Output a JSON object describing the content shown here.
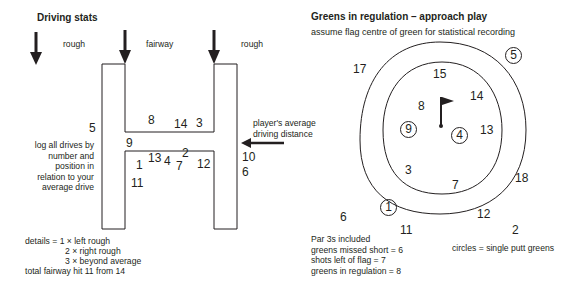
{
  "driving": {
    "title": "Driving stats",
    "labels": {
      "rough_left": "rough",
      "fairway": "fairway",
      "rough_right": "rough"
    },
    "avg_label_1": "player's average",
    "avg_label_2": "driving distance",
    "instructions": [
      "log all drives by",
      "number and",
      "position in",
      "relation to your",
      "average drive"
    ],
    "drives": {
      "d1": "1",
      "d2": "2",
      "d3": "3",
      "d4": "4",
      "d5": "5",
      "d6": "6",
      "d7": "7",
      "d8": "8",
      "d9": "9",
      "d10": "10",
      "d11": "11",
      "d12": "12",
      "d13": "13",
      "d14": "14"
    },
    "details": [
      "details = 1 × left rough",
      "2 × right rough",
      "3 × beyond average",
      "total fairway hit  11 from 14"
    ]
  },
  "greens": {
    "title": "Greens in regulation – approach play",
    "subtitle": "assume flag centre of green for statistical recording",
    "holes": {
      "h1": "1",
      "h2": "2",
      "h3": "3",
      "h4": "4",
      "h5": "5",
      "h6": "6",
      "h7": "7",
      "h8": "8",
      "h9": "9",
      "h11": "11",
      "h12": "12",
      "h13": "13",
      "h14": "14",
      "h15": "15",
      "h17": "17",
      "h18": "18"
    },
    "summary": [
      "Par 3s included",
      "greens missed short = 6",
      "shots left of flag = 7",
      "greens in regulation = 8"
    ],
    "legend": "circles = single putt greens"
  }
}
